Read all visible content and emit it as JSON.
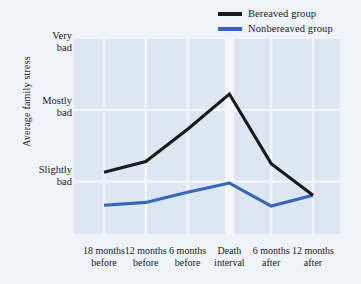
{
  "chart_data": {
    "type": "line",
    "title": "",
    "xlabel": "",
    "ylabel": "Average family stress",
    "categories": [
      "18 months before",
      "12 months before",
      "6 months before",
      "Death interval",
      "6 months after",
      "12 months after"
    ],
    "category_lines": [
      [
        "18 months",
        "before"
      ],
      [
        "12 months",
        "before"
      ],
      [
        "6 months",
        "before"
      ],
      [
        "Death",
        "interval"
      ],
      [
        "6 months",
        "after"
      ],
      [
        "12 months",
        "after"
      ]
    ],
    "ytick_labels": [
      [
        "Very",
        "bad"
      ],
      [
        "Mostly",
        "bad"
      ],
      [
        "Slightly",
        "bad"
      ]
    ],
    "ytick_values": [
      3,
      2,
      1
    ],
    "ylim": [
      0.27,
      3.0
    ],
    "grid": true,
    "legend_position": "top-right",
    "series": [
      {
        "name": "Bereaved group",
        "color": "#1a1a1a",
        "values": [
          1.13,
          1.28,
          1.73,
          2.22,
          1.25,
          0.81
        ]
      },
      {
        "name": "Nonbereaved group",
        "color": "#3566bb",
        "values": [
          0.67,
          0.71,
          0.85,
          0.98,
          0.66,
          0.81
        ]
      }
    ]
  },
  "legend": {
    "items": [
      {
        "label": "Bereaved group",
        "color": "#1a1a1a"
      },
      {
        "label": "Nonbereaved group",
        "color": "#3566bb"
      }
    ]
  },
  "axis": {
    "y_title": "Average family stress",
    "y_ticks": [
      {
        "line1": "Very",
        "line2": "bad"
      },
      {
        "line1": "Mostly",
        "line2": "bad"
      },
      {
        "line1": "Slightly",
        "line2": "bad"
      }
    ],
    "x_ticks": [
      {
        "line1": "18 months",
        "line2": "before"
      },
      {
        "line1": "12 months",
        "line2": "before"
      },
      {
        "line1": "6 months",
        "line2": "before"
      },
      {
        "line1": "Death",
        "line2": "interval"
      },
      {
        "line1": "6 months",
        "line2": "after"
      },
      {
        "line1": "12 months",
        "line2": "after"
      }
    ]
  },
  "colors": {
    "page_background": "#eef4f9",
    "plot_background": "#dde7f1",
    "gridline": "#f4f8fc",
    "bereaved": "#1a1a1a",
    "nonbereaved": "#3566bb",
    "text": "#1a1a22"
  }
}
